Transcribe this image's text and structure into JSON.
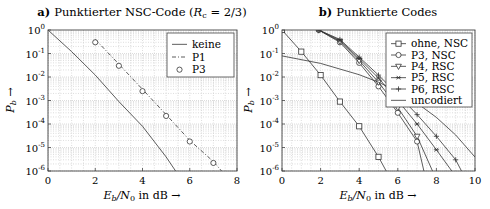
{
  "chart_data": [
    {
      "type": "line",
      "panel": "a",
      "title_prefix": "a)",
      "title": "Punktierter NSC-Code (R_c = 2/3)",
      "title_text": "Punktierter NSC-Code (",
      "title_rate": "R",
      "title_rate_sub": "c",
      "title_rest": " = 2/3)",
      "xlabel": "E_b/N_0 in dB →",
      "ylabel": "P_b →",
      "xlim": [
        0,
        8
      ],
      "ylim": [
        1e-06,
        1
      ],
      "yscale": "log",
      "grid": true,
      "legend_position": "upper right",
      "xticks": [
        "0",
        "2",
        "4",
        "6",
        "8"
      ],
      "yticks": [
        "10^0",
        "10^-1",
        "10^-2",
        "10^-3",
        "10^-4",
        "10^-5",
        "10^-6"
      ],
      "series": [
        {
          "name": "keine",
          "style": "solid",
          "marker": "none",
          "x": [
            0,
            1,
            2,
            3,
            4,
            5,
            5.4
          ],
          "y": [
            1.0,
            0.12,
            0.012,
            0.0009,
            8e-05,
            4e-06,
            1e-06
          ]
        },
        {
          "name": "P1",
          "style": "dashdot",
          "marker": "none",
          "x": [
            2,
            3,
            4,
            5,
            6,
            7,
            7.35
          ],
          "y": [
            0.4,
            0.035,
            0.003,
            0.00025,
            2e-05,
            2.5e-06,
            1e-06
          ]
        },
        {
          "name": "P3",
          "style": "none",
          "marker": "circle",
          "x": [
            2,
            3,
            4,
            5,
            6,
            7
          ],
          "y": [
            0.3,
            0.03,
            0.0025,
            0.00022,
            1.8e-05,
            2.2e-06
          ]
        }
      ]
    },
    {
      "type": "line",
      "panel": "b",
      "title_prefix": "b)",
      "title": "Punktierte Codes",
      "xlabel": "E_b/N_0 in dB →",
      "ylabel": "P_b →",
      "xlim": [
        0,
        10
      ],
      "ylim": [
        1e-06,
        1
      ],
      "yscale": "log",
      "grid": true,
      "legend_position": "upper right",
      "xticks": [
        "0",
        "2",
        "4",
        "6",
        "8",
        "10"
      ],
      "yticks": [
        "10^0",
        "10^-1",
        "10^-2",
        "10^-3",
        "10^-4",
        "10^-5",
        "10^-6"
      ],
      "series": [
        {
          "name": "ohne, NSC",
          "marker": "square",
          "x": [
            0,
            1,
            2,
            3,
            4,
            5,
            5.4
          ],
          "y": [
            1.0,
            0.12,
            0.012,
            0.0009,
            8e-05,
            4e-06,
            1e-06
          ]
        },
        {
          "name": "P3, NSC",
          "marker": "circle",
          "x": [
            1.9,
            3,
            4,
            5,
            6,
            7,
            7.35
          ],
          "y": [
            1.0,
            0.3,
            0.04,
            0.004,
            0.0003,
            1.8e-05,
            1e-06
          ]
        },
        {
          "name": "P4, RSC",
          "marker": "triangle-down",
          "x": [
            1.9,
            3,
            4,
            5,
            6,
            7,
            7.8
          ],
          "y": [
            1.0,
            0.33,
            0.05,
            0.006,
            0.0005,
            3e-05,
            1e-06
          ]
        },
        {
          "name": "P5, RSC",
          "marker": "asterisk",
          "x": [
            1.9,
            3,
            4,
            5,
            6,
            7,
            8,
            8.8
          ],
          "y": [
            1.0,
            0.36,
            0.06,
            0.009,
            0.001,
            0.0001,
            8e-06,
            1e-06
          ]
        },
        {
          "name": "P6, RSC",
          "marker": "plus",
          "x": [
            1.9,
            3,
            4,
            5,
            6,
            7,
            8,
            9,
            9.3
          ],
          "y": [
            1.0,
            0.4,
            0.07,
            0.012,
            0.0018,
            0.00025,
            3e-05,
            3e-06,
            1e-06
          ]
        },
        {
          "name": "uncodiert",
          "marker": "none",
          "x": [
            0,
            2,
            4,
            5,
            6,
            7,
            8,
            9,
            10
          ],
          "y": [
            0.079,
            0.038,
            0.0125,
            0.006,
            0.0024,
            0.00077,
            0.00019,
            3.4e-05,
            3.9e-06
          ]
        }
      ]
    }
  ]
}
